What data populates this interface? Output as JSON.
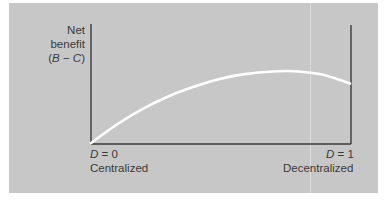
{
  "chart_data": {
    "type": "line",
    "title": "",
    "ylabel": [
      "Net",
      "benefit",
      "(B − C)"
    ],
    "ylabel_parts": {
      "line1": "Net",
      "line2": "benefit",
      "line3_open": "(",
      "line3_b": "B",
      "line3_minus": " − ",
      "line3_c": "C",
      "line3_close": ")"
    },
    "xlabel": "",
    "x_ticks": [
      {
        "var": "D",
        "eq": " = 0",
        "caption": "Centralized",
        "x": 0
      },
      {
        "var": "D",
        "eq": " = 1",
        "caption": "Decentralized",
        "x": 1
      }
    ],
    "xlim": [
      0,
      1
    ],
    "ylim": [
      0,
      1
    ],
    "grid": false,
    "legend": null,
    "series": [
      {
        "name": "Net benefit",
        "color": "#ffffff",
        "x": [
          0.0,
          0.1,
          0.2,
          0.3,
          0.4,
          0.5,
          0.6,
          0.7,
          0.75,
          0.8,
          0.9,
          1.0
        ],
        "y": [
          0.0,
          0.19,
          0.35,
          0.48,
          0.58,
          0.66,
          0.71,
          0.735,
          0.74,
          0.735,
          0.7,
          0.61
        ]
      }
    ]
  },
  "colors": {
    "panel_bg": "#c7c7c7",
    "axis": "#3a3a3a",
    "curve": "#ffffff",
    "text": "#3a3a3a"
  }
}
